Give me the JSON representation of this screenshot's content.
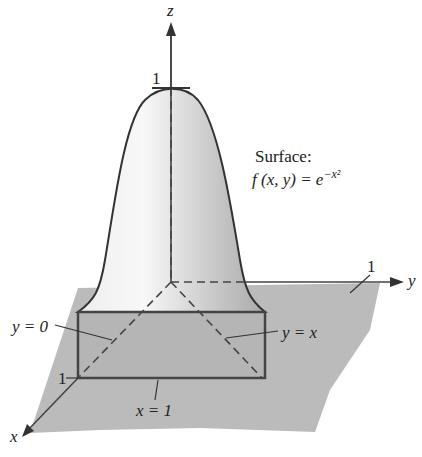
{
  "figure": {
    "axes": {
      "x": "x",
      "y": "y",
      "z": "z"
    },
    "ticks": {
      "z_one": "1",
      "y_one": "1",
      "x_one": "1"
    },
    "surface_title": "Surface:",
    "surface_formula": "f (x, y) = e",
    "surface_exponent": "−x²",
    "labels": {
      "y_eq_0": "y = 0",
      "y_eq_x": "y = x",
      "x_eq_1": "x = 1"
    }
  }
}
